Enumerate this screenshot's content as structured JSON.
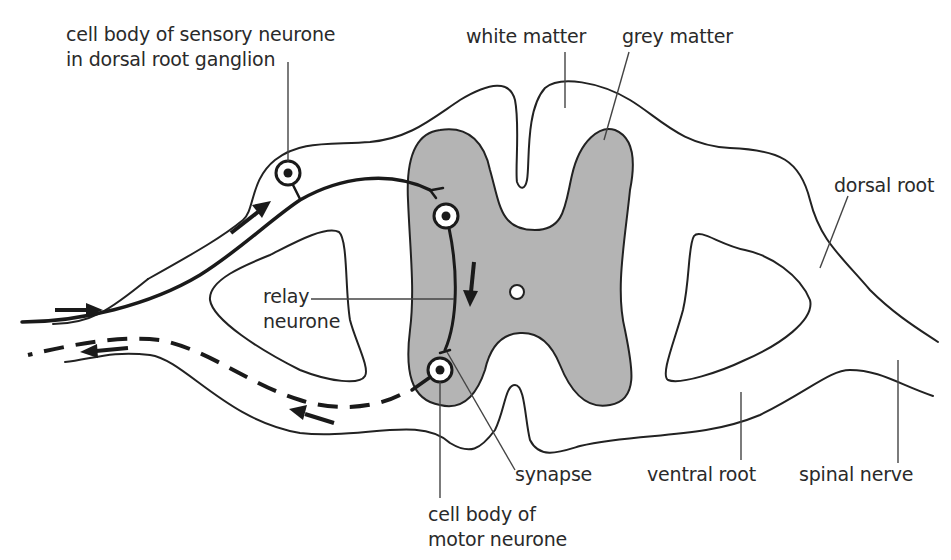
{
  "diagram": {
    "colors": {
      "grey_matter": "#b4b4b4",
      "white_matter": "#ffffff",
      "outline": "#222222",
      "label_text": "#2a2a2a"
    },
    "labels": {
      "sensory_cell_body": {
        "line1": "cell body of sensory neurone",
        "line2": "in dorsal root ganglion"
      },
      "white_matter": "white matter",
      "grey_matter": "grey matter",
      "dorsal_root": "dorsal root",
      "relay_neurone": {
        "line1": "relay",
        "line2": "neurone"
      },
      "synapse": "synapse",
      "ventral_root": "ventral root",
      "spinal_nerve": "spinal nerve",
      "motor_cell_body": {
        "line1": "cell body of",
        "line2": "motor neurone"
      }
    },
    "pathway": {
      "sensory_neurone_style": "solid",
      "motor_neurone_style": "dashed",
      "arrows": [
        {
          "location": "left nerve, upper",
          "direction": "right (towards cord)"
        },
        {
          "location": "dorsal root",
          "direction": "up-right (towards cord)"
        },
        {
          "location": "relay neurone",
          "direction": "down"
        },
        {
          "location": "ventral root",
          "direction": "left (away from cord)"
        },
        {
          "location": "left nerve, lower",
          "direction": "left (away from cord)"
        }
      ]
    }
  }
}
